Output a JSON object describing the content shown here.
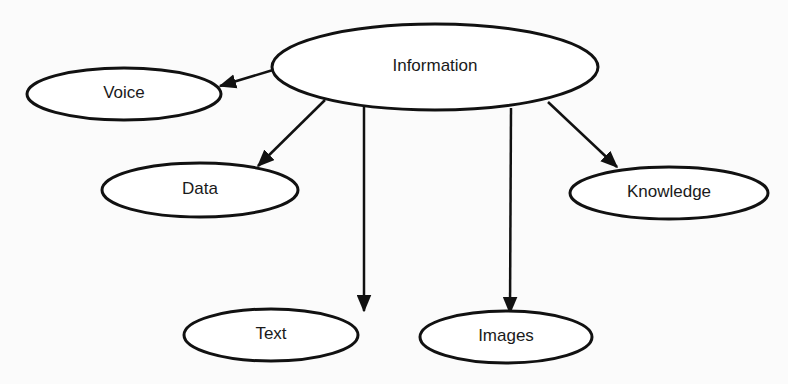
{
  "diagram": {
    "type": "concept-map",
    "colors": {
      "stroke": "#111111",
      "text": "#1a1a1a",
      "background": "#fbfbfb",
      "node_fill": "#ffffff"
    },
    "nodes": [
      {
        "id": "information",
        "label": "Information",
        "cx": 435,
        "cy": 67,
        "rx": 163,
        "ry": 43
      },
      {
        "id": "voice",
        "label": "Voice",
        "cx": 124,
        "cy": 94,
        "rx": 97,
        "ry": 26
      },
      {
        "id": "data",
        "label": "Data",
        "cx": 200,
        "cy": 190,
        "rx": 98,
        "ry": 27
      },
      {
        "id": "knowledge",
        "label": "Knowledge",
        "cx": 669,
        "cy": 193,
        "rx": 99,
        "ry": 26
      },
      {
        "id": "text",
        "label": "Text",
        "cx": 271,
        "cy": 335,
        "rx": 87,
        "ry": 26
      },
      {
        "id": "images",
        "label": "Images",
        "cx": 506,
        "cy": 337,
        "rx": 86,
        "ry": 26
      }
    ],
    "edges": [
      {
        "from": "information",
        "to": "voice",
        "x1": 273,
        "y1": 70,
        "x2": 220,
        "y2": 86
      },
      {
        "from": "information",
        "to": "data",
        "x1": 325,
        "y1": 100,
        "x2": 258,
        "y2": 166
      },
      {
        "from": "information",
        "to": "text",
        "x1": 364,
        "y1": 107,
        "x2": 364,
        "y2": 311
      },
      {
        "from": "information",
        "to": "images",
        "x1": 511,
        "y1": 108,
        "x2": 510,
        "y2": 313
      },
      {
        "from": "information",
        "to": "knowledge",
        "x1": 548,
        "y1": 102,
        "x2": 617,
        "y2": 167
      }
    ]
  }
}
